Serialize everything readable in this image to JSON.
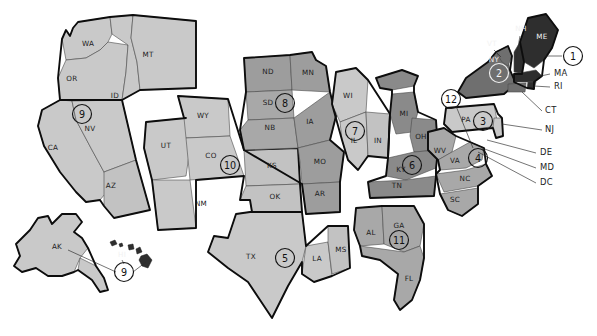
{
  "figure": {
    "kind": "us-states-region-map",
    "background": "#ffffff",
    "outline_color": "#0d0d0d",
    "state_border_color": "#4a4a4a"
  },
  "palette": {
    "tone_light": "#c9c9c9",
    "tone_light2": "#c2c2c2",
    "tone_mid": "#a8a8a8",
    "tone_mid2": "#9d9d9d",
    "tone_dark": "#8a8a8a",
    "tone_darker": "#6f6f6f",
    "tone_near_black": "#2e2e2e",
    "white_gap": "#ffffff"
  },
  "state_labels": [
    {
      "abbr": "WA",
      "x": 88,
      "y": 46
    },
    {
      "abbr": "MT",
      "x": 148,
      "y": 57
    },
    {
      "abbr": "OR",
      "x": 72,
      "y": 81
    },
    {
      "abbr": "ID",
      "x": 115,
      "y": 98
    },
    {
      "abbr": "NV",
      "x": 90,
      "y": 131
    },
    {
      "abbr": "CA",
      "x": 53,
      "y": 150
    },
    {
      "abbr": "AZ",
      "x": 111,
      "y": 188
    },
    {
      "abbr": "UT",
      "x": 166,
      "y": 148
    },
    {
      "abbr": "WY",
      "x": 203,
      "y": 118
    },
    {
      "abbr": "CO",
      "x": 211,
      "y": 158
    },
    {
      "abbr": "NM",
      "x": 201,
      "y": 206
    },
    {
      "abbr": "ND",
      "x": 268,
      "y": 74
    },
    {
      "abbr": "MN",
      "x": 308,
      "y": 75
    },
    {
      "abbr": "SD",
      "x": 268,
      "y": 105
    },
    {
      "abbr": "NB",
      "x": 270,
      "y": 130
    },
    {
      "abbr": "IA",
      "x": 310,
      "y": 124
    },
    {
      "abbr": "KS",
      "x": 272,
      "y": 168
    },
    {
      "abbr": "MO",
      "x": 320,
      "y": 164
    },
    {
      "abbr": "OK",
      "x": 275,
      "y": 199
    },
    {
      "abbr": "AR",
      "x": 320,
      "y": 196
    },
    {
      "abbr": "TX",
      "x": 251,
      "y": 259
    },
    {
      "abbr": "LA",
      "x": 317,
      "y": 261
    },
    {
      "abbr": "MS",
      "x": 341,
      "y": 252
    },
    {
      "abbr": "WI",
      "x": 348,
      "y": 98
    },
    {
      "abbr": "IL",
      "x": 354,
      "y": 143
    },
    {
      "abbr": "IN",
      "x": 378,
      "y": 143
    },
    {
      "abbr": "MI",
      "x": 404,
      "y": 116
    },
    {
      "abbr": "OH",
      "x": 421,
      "y": 139
    },
    {
      "abbr": "KY",
      "x": 401,
      "y": 172
    },
    {
      "abbr": "TN",
      "x": 397,
      "y": 188
    },
    {
      "abbr": "AL",
      "x": 371,
      "y": 235
    },
    {
      "abbr": "GA",
      "x": 399,
      "y": 228
    },
    {
      "abbr": "FL",
      "x": 409,
      "y": 281
    },
    {
      "abbr": "SC",
      "x": 455,
      "y": 202
    },
    {
      "abbr": "NC",
      "x": 465,
      "y": 181
    },
    {
      "abbr": "VA",
      "x": 455,
      "y": 163
    },
    {
      "abbr": "WV",
      "x": 440,
      "y": 153
    },
    {
      "abbr": "PA",
      "x": 466,
      "y": 122
    },
    {
      "abbr": "NY",
      "x": 494,
      "y": 62
    },
    {
      "abbr": "VT",
      "x": 492,
      "y": 46
    },
    {
      "abbr": "NH",
      "x": 521,
      "y": 31
    },
    {
      "abbr": "ME",
      "x": 542,
      "y": 39
    },
    {
      "abbr": "AK",
      "x": 57,
      "y": 249
    },
    {
      "abbr": "HI",
      "x": 122,
      "y": 257
    }
  ],
  "side_labels": [
    {
      "text": "MA",
      "x": 554,
      "y": 76
    },
    {
      "text": "RI",
      "x": 554,
      "y": 89
    },
    {
      "text": "CT",
      "x": 545,
      "y": 113
    },
    {
      "text": "NJ",
      "x": 545,
      "y": 132
    },
    {
      "text": "DE",
      "x": 540,
      "y": 155
    },
    {
      "text": "MD",
      "x": 540,
      "y": 170
    },
    {
      "text": "DC",
      "x": 540,
      "y": 185
    }
  ],
  "region_markers": [
    {
      "number": "1",
      "x": 573,
      "y": 56,
      "r": 9.5,
      "on_dark": false,
      "states": [
        "ME",
        "NH",
        "MA",
        "RI"
      ]
    },
    {
      "number": "2",
      "x": 499,
      "y": 73,
      "r": 9.5,
      "on_dark": true,
      "states": [
        "NY",
        "VT"
      ]
    },
    {
      "number": "3",
      "x": 483,
      "y": 121,
      "r": 9.5,
      "on_dark": false,
      "states": [
        "PA",
        "NJ"
      ]
    },
    {
      "number": "4",
      "x": 478,
      "y": 158,
      "r": 9.5,
      "on_dark": false,
      "states": [
        "WV",
        "VA",
        "NC",
        "SC",
        "MD",
        "DE",
        "DC"
      ]
    },
    {
      "number": "5",
      "x": 285,
      "y": 258,
      "r": 9.5,
      "on_dark": false,
      "states": [
        "TX",
        "LA",
        "MS"
      ]
    },
    {
      "number": "6",
      "x": 412,
      "y": 165,
      "r": 9.5,
      "on_dark": false,
      "states": [
        "MI",
        "OH",
        "KY",
        "TN"
      ]
    },
    {
      "number": "7",
      "x": 355,
      "y": 131,
      "r": 9.5,
      "on_dark": false,
      "states": [
        "WI",
        "IL",
        "IN"
      ]
    },
    {
      "number": "8",
      "x": 285,
      "y": 103,
      "r": 9.5,
      "on_dark": false,
      "states": [
        "ND",
        "MN",
        "SD",
        "NB",
        "IA",
        "MO",
        "AR"
      ]
    },
    {
      "number": "9",
      "x": 82,
      "y": 114,
      "r": 9.5,
      "on_dark": false,
      "states": [
        "CA",
        "NV",
        "AZ",
        "AK",
        "HI"
      ]
    },
    {
      "number": "9",
      "x": 124,
      "y": 272,
      "r": 9.5,
      "on_dark": false,
      "states": [
        "AK",
        "HI"
      ]
    },
    {
      "number": "10",
      "x": 230,
      "y": 165,
      "r": 9.5,
      "on_dark": false,
      "states": [
        "UT",
        "WY",
        "CO",
        "NM",
        "KS",
        "OK"
      ]
    },
    {
      "number": "11",
      "x": 399,
      "y": 240,
      "r": 9.5,
      "on_dark": false,
      "states": [
        "AL",
        "GA",
        "FL"
      ]
    },
    {
      "number": "12",
      "x": 451,
      "y": 99,
      "r": 9.5,
      "on_dark": false,
      "states": [
        "MD",
        "DC"
      ]
    }
  ],
  "region_numbers_visible": [
    "1",
    "2",
    "3",
    "4",
    "5",
    "6",
    "7",
    "8",
    "9",
    "9",
    "10",
    "11",
    "12"
  ]
}
